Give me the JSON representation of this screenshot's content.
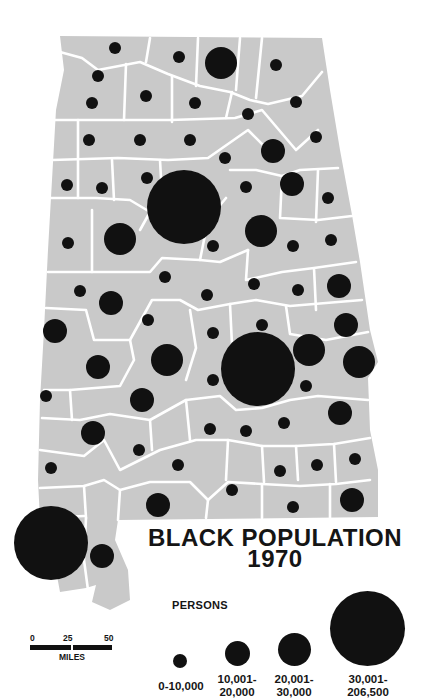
{
  "map": {
    "title_line1": "BLACK POPULATION",
    "title_line2": "1970",
    "region": "Alabama (counties)",
    "colors": {
      "land": "#c9c9c9",
      "borders": "#ffffff",
      "symbols": "#111111",
      "background": "#ffffff"
    }
  },
  "legend": {
    "heading": "PERSONS",
    "classes": [
      {
        "line1": "0-10,000",
        "line2": "",
        "radius": 6
      },
      {
        "line1": "10,001-",
        "line2": "20,000",
        "radius": 12
      },
      {
        "line1": "20,001-",
        "line2": "30,000",
        "radius": 16
      },
      {
        "line1": "30,001-",
        "line2": "206,500",
        "radius": 37
      }
    ]
  },
  "scale_bar": {
    "ticks": [
      "0",
      "25",
      "50"
    ],
    "unit": "MILES"
  },
  "chart_data": {
    "type": "proportional_symbol_map",
    "title": "BLACK POPULATION 1970",
    "legend_title": "PERSONS",
    "classes": [
      "0-10,000",
      "10,001-20,000",
      "20,001-30,000",
      "30,001-206,500"
    ],
    "symbols": [
      {
        "x": 115,
        "y": 48,
        "cls": 0
      },
      {
        "x": 179,
        "y": 57,
        "cls": 0
      },
      {
        "x": 221,
        "y": 63,
        "cls": 2
      },
      {
        "x": 276,
        "y": 65,
        "cls": 0
      },
      {
        "x": 98,
        "y": 76,
        "cls": 0
      },
      {
        "x": 146,
        "y": 96,
        "cls": 0
      },
      {
        "x": 92,
        "y": 103,
        "cls": 0
      },
      {
        "x": 195,
        "y": 103,
        "cls": 0
      },
      {
        "x": 296,
        "y": 102,
        "cls": 0
      },
      {
        "x": 248,
        "y": 114,
        "cls": 0
      },
      {
        "x": 89,
        "y": 140,
        "cls": 0
      },
      {
        "x": 140,
        "y": 140,
        "cls": 0
      },
      {
        "x": 190,
        "y": 140,
        "cls": 0
      },
      {
        "x": 316,
        "y": 137,
        "cls": 0
      },
      {
        "x": 225,
        "y": 158,
        "cls": 0
      },
      {
        "x": 273,
        "y": 151,
        "cls": 1
      },
      {
        "x": 67,
        "y": 185,
        "cls": 0
      },
      {
        "x": 102,
        "y": 188,
        "cls": 0
      },
      {
        "x": 147,
        "y": 178,
        "cls": 0
      },
      {
        "x": 184,
        "y": 207,
        "cls": 3
      },
      {
        "x": 246,
        "y": 187,
        "cls": 0
      },
      {
        "x": 292,
        "y": 184,
        "cls": 1
      },
      {
        "x": 328,
        "y": 198,
        "cls": 0
      },
      {
        "x": 120,
        "y": 239,
        "cls": 2
      },
      {
        "x": 68,
        "y": 243,
        "cls": 0
      },
      {
        "x": 213,
        "y": 246,
        "cls": 0
      },
      {
        "x": 261,
        "y": 231,
        "cls": 2
      },
      {
        "x": 293,
        "y": 246,
        "cls": 0
      },
      {
        "x": 331,
        "y": 240,
        "cls": 0
      },
      {
        "x": 80,
        "y": 291,
        "cls": 0
      },
      {
        "x": 165,
        "y": 277,
        "cls": 0
      },
      {
        "x": 111,
        "y": 303,
        "cls": 1
      },
      {
        "x": 207,
        "y": 295,
        "cls": 0
      },
      {
        "x": 254,
        "y": 284,
        "cls": 0
      },
      {
        "x": 298,
        "y": 290,
        "cls": 0
      },
      {
        "x": 339,
        "y": 286,
        "cls": 1
      },
      {
        "x": 55,
        "y": 331,
        "cls": 1
      },
      {
        "x": 148,
        "y": 320,
        "cls": 0
      },
      {
        "x": 213,
        "y": 333,
        "cls": 0
      },
      {
        "x": 262,
        "y": 325,
        "cls": 0
      },
      {
        "x": 346,
        "y": 325,
        "cls": 1
      },
      {
        "x": 98,
        "y": 367,
        "cls": 1
      },
      {
        "x": 167,
        "y": 360,
        "cls": 2
      },
      {
        "x": 258,
        "y": 369,
        "cls": 3
      },
      {
        "x": 309,
        "y": 350,
        "cls": 2
      },
      {
        "x": 359,
        "y": 362,
        "cls": 2
      },
      {
        "x": 213,
        "y": 380,
        "cls": 0
      },
      {
        "x": 306,
        "y": 386,
        "cls": 0
      },
      {
        "x": 46,
        "y": 396,
        "cls": 0
      },
      {
        "x": 142,
        "y": 400,
        "cls": 1
      },
      {
        "x": 340,
        "y": 413,
        "cls": 1
      },
      {
        "x": 93,
        "y": 433,
        "cls": 1
      },
      {
        "x": 210,
        "y": 429,
        "cls": 0
      },
      {
        "x": 246,
        "y": 431,
        "cls": 0
      },
      {
        "x": 284,
        "y": 423,
        "cls": 0
      },
      {
        "x": 139,
        "y": 450,
        "cls": 0
      },
      {
        "x": 178,
        "y": 465,
        "cls": 0
      },
      {
        "x": 51,
        "y": 468,
        "cls": 0
      },
      {
        "x": 280,
        "y": 471,
        "cls": 0
      },
      {
        "x": 317,
        "y": 465,
        "cls": 0
      },
      {
        "x": 355,
        "y": 459,
        "cls": 0
      },
      {
        "x": 232,
        "y": 490,
        "cls": 0
      },
      {
        "x": 158,
        "y": 505,
        "cls": 1
      },
      {
        "x": 293,
        "y": 507,
        "cls": 0
      },
      {
        "x": 352,
        "y": 500,
        "cls": 1
      },
      {
        "x": 51,
        "y": 543,
        "cls": 3
      },
      {
        "x": 102,
        "y": 556,
        "cls": 1
      }
    ],
    "class_radii_px": [
      6,
      12,
      16,
      37
    ]
  }
}
